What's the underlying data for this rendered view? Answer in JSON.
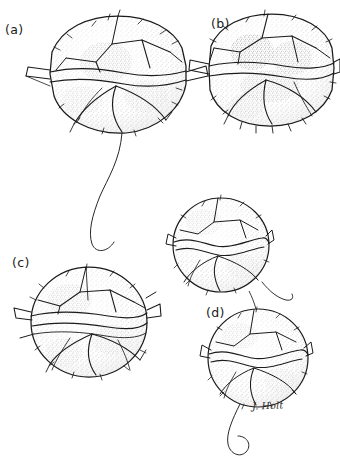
{
  "figure": {
    "domain_note": "Scientific ink line-drawing plate of armoured dinoflagellate cells",
    "background_color": "#ffffff",
    "ink_color": "#1b1b1b",
    "stipple_color": "#5a5a5a",
    "width": 340,
    "height": 467,
    "caption_sliver": "",
    "artist_signature": "J. Holt",
    "panels": [
      {
        "id": "a",
        "label": "(a)",
        "subject": "dinoflagellate cell, apical/ventral view with plate sutures",
        "outline": "rounded polygonal theca with lateral cingular flanges",
        "has_flagellum": true,
        "flagellum_description": "long sinuous trailing flagellum curving down and to the right",
        "center_x": 118,
        "center_y": 74,
        "radius_x": 68,
        "radius_y": 58
      },
      {
        "id": "b",
        "label": "(b)",
        "subject": "dinoflagellate cell, dorsal view with dense stippled chromatophores",
        "outline": "rounded polygonal theca with lateral cingular flanges",
        "has_flagellum": false,
        "flagellum_description": "",
        "center_x": 272,
        "center_y": 70,
        "radius_x": 62,
        "radius_y": 56
      },
      {
        "id": "c",
        "label": "(c)",
        "subject": "dinoflagellate cell, lateral view showing girdle and plate pattern",
        "outline": "near-circular theca with pointed lateral spurs",
        "has_flagellum": false,
        "flagellum_description": "",
        "center_x": 89,
        "center_y": 322,
        "radius_x": 60,
        "radius_y": 57
      },
      {
        "id": "d-upper",
        "label": "",
        "subject": "dividing dinoflagellate, upper daughter cell",
        "outline": "circular theca with sinuous suture lines",
        "has_flagellum": true,
        "flagellum_description": "short flagellum trailing from lower right",
        "center_x": 221,
        "center_y": 245,
        "radius_x": 49,
        "radius_y": 48
      },
      {
        "id": "d-lower",
        "label": "(d)",
        "subject": "dividing dinoflagellate, lower daughter cell",
        "outline": "circular theca with sinuous suture lines",
        "has_flagellum": true,
        "flagellum_description": "long curling flagellum trailing from the base",
        "center_x": 258,
        "center_y": 358,
        "radius_x": 51,
        "radius_y": 50
      }
    ]
  }
}
